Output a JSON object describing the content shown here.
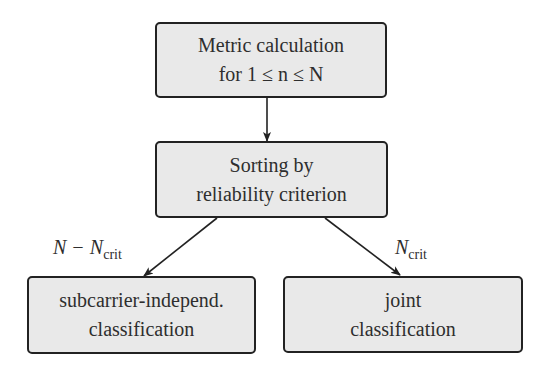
{
  "diagram": {
    "nodes": [
      {
        "id": "metric",
        "lines": [
          "Metric calculation",
          "for 1 ≤ n ≤ N"
        ]
      },
      {
        "id": "sorting",
        "lines": [
          "Sorting by",
          "reliability criterion"
        ]
      },
      {
        "id": "independent",
        "lines": [
          "subcarrier-independ.",
          "classification"
        ]
      },
      {
        "id": "joint",
        "lines": [
          "joint",
          "classification"
        ]
      }
    ],
    "edges": [
      {
        "from": "metric",
        "to": "sorting",
        "label": ""
      },
      {
        "from": "sorting",
        "to": "independent",
        "label_main": "N − N",
        "label_sub": "crit"
      },
      {
        "from": "sorting",
        "to": "joint",
        "label_main": "N",
        "label_sub": "crit"
      }
    ],
    "colors": {
      "box_fill": "#e9e9e9",
      "border": "#222222",
      "arrow": "#222222"
    }
  }
}
